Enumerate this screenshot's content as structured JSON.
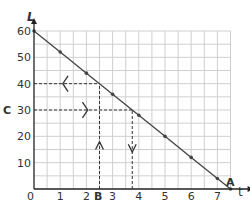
{
  "chart_data": {
    "type": "line",
    "title": "",
    "xlabel": "t",
    "ylabel": "L",
    "xlim": [
      0,
      8
    ],
    "ylim": [
      0,
      60
    ],
    "grid": true,
    "x_ticks": [
      "0",
      "1",
      "2",
      "3",
      "4",
      "5",
      "6",
      "7"
    ],
    "y_ticks": [
      "10",
      "20",
      "30",
      "40",
      "50",
      "60"
    ],
    "series": [
      {
        "name": "L vs t",
        "x": [
          0,
          1,
          2,
          3,
          4,
          5,
          6,
          7,
          7.5
        ],
        "y": [
          60,
          52,
          44,
          36,
          28,
          20,
          12,
          4,
          0
        ]
      }
    ],
    "annotations": [
      {
        "label": "A",
        "x": 7.5,
        "y": 0
      },
      {
        "label": "B",
        "x": 2.5,
        "y": 0,
        "note": "dashed line from B up to L=40, arrow left to L axis"
      },
      {
        "label": "C",
        "x": 0,
        "y": 30,
        "note": "dashed line from C right to line at t≈3.75, arrow down to t axis"
      }
    ]
  },
  "labels": {
    "y_axis": "L",
    "x_axis": "t",
    "origin": "0",
    "A": "A",
    "B": "B",
    "C": "C"
  }
}
